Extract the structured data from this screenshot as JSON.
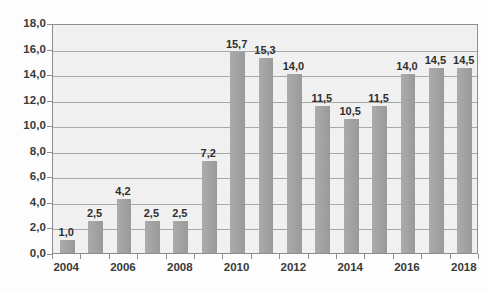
{
  "chart_data": {
    "type": "bar",
    "title": "",
    "subtitle": "",
    "xlabel": "",
    "ylabel": "",
    "categories": [
      "2004",
      "2005",
      "2006",
      "2007",
      "2008",
      "2009",
      "2010",
      "2011",
      "2012",
      "2013",
      "2014",
      "2015",
      "2016",
      "2017",
      "2018"
    ],
    "values": [
      1.0,
      2.5,
      4.2,
      2.5,
      2.5,
      7.2,
      15.7,
      15.3,
      14.0,
      11.5,
      10.5,
      11.5,
      14.0,
      14.5,
      14.5
    ],
    "data_labels": [
      "1,0",
      "2,5",
      "4,2",
      "2,5",
      "2,5",
      "7,2",
      "15,7",
      "15,3",
      "14,0",
      "11,5",
      "10,5",
      "11,5",
      "14,0",
      "14,5",
      "14,5"
    ],
    "ylim": [
      0,
      18
    ],
    "ytick_values": [
      0,
      2,
      4,
      6,
      8,
      10,
      12,
      14,
      16,
      18
    ],
    "ytick_labels": [
      "0,0",
      "2,0",
      "4,0",
      "6,0",
      "8,0",
      "10,0",
      "12,0",
      "14,0",
      "16,0",
      "18,0"
    ],
    "xtick_labels": [
      "2004",
      "2006",
      "2008",
      "2010",
      "2012",
      "2014",
      "2016",
      "2018"
    ],
    "xtick_categories": [
      "2004",
      "2006",
      "2008",
      "2010",
      "2012",
      "2014",
      "2016",
      "2018"
    ],
    "grid": true,
    "grid_axis": "y",
    "legend": false,
    "legend_position": "none",
    "decimal_separator": ",",
    "series": [
      {
        "name": "",
        "values": [
          1.0,
          2.5,
          4.2,
          2.5,
          2.5,
          7.2,
          15.7,
          15.3,
          14.0,
          11.5,
          10.5,
          11.5,
          14.0,
          14.5,
          14.5
        ]
      }
    ],
    "colors": {
      "bar": "#a3a3a3",
      "plot_background": "#f2f2f2",
      "gridline": "#a9a9a9",
      "axis": "#8e8e8e",
      "label_text": "#3a3a3a",
      "value_text": "#2f2f2f",
      "page_background": "#fdfdfd"
    }
  }
}
